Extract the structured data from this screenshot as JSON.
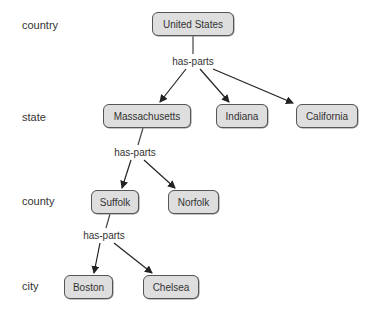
{
  "diagram": {
    "type": "hierarchy",
    "levels": [
      {
        "label": "country"
      },
      {
        "label": "state"
      },
      {
        "label": "county"
      },
      {
        "label": "city"
      }
    ],
    "relation_label": "has-parts",
    "nodes": {
      "united_states": "United States",
      "massachusetts": "Massachusetts",
      "indiana": "Indiana",
      "california": "California",
      "suffolk": "Suffolk",
      "norfolk": "Norfolk",
      "boston": "Boston",
      "chelsea": "Chelsea"
    },
    "edges": [
      {
        "from": "United States",
        "label": "has-parts",
        "to": [
          "Massachusetts",
          "Indiana",
          "California"
        ]
      },
      {
        "from": "Massachusetts",
        "label": "has-parts",
        "to": [
          "Suffolk",
          "Norfolk"
        ]
      },
      {
        "from": "Suffolk",
        "label": "has-parts",
        "to": [
          "Boston",
          "Chelsea"
        ]
      }
    ],
    "colors": {
      "node_fill": "#dedede",
      "node_border": "#555555",
      "edge": "#222222"
    }
  }
}
